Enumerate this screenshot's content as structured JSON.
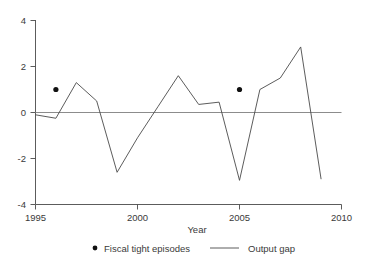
{
  "chart_data": {
    "type": "line",
    "title": "",
    "subtitle": "",
    "xlabel": "Year",
    "ylabel": "",
    "xlim": [
      1995,
      2010
    ],
    "ylim": [
      -4,
      4
    ],
    "grid": false,
    "legend_position": "bottom",
    "x_ticks": [
      1995,
      2000,
      2005,
      2010
    ],
    "x_tick_labels": [
      "1995",
      "2000",
      "2005",
      "2010"
    ],
    "y_ticks": [
      4,
      2,
      0,
      -2,
      -4
    ],
    "y_tick_labels": [
      "4",
      "2",
      "0",
      "-2",
      "-4"
    ],
    "zero_line": 0,
    "series": [
      {
        "name": "Output gap",
        "type": "line",
        "x": [
          1995,
          1996,
          1997,
          1998,
          1999,
          2000,
          2001,
          2002,
          2003,
          2004,
          2005,
          2006,
          2007,
          2008,
          2009
        ],
        "values": [
          -0.1,
          -0.25,
          1.3,
          0.5,
          -2.6,
          -1.1,
          0.25,
          1.6,
          0.35,
          0.45,
          -2.95,
          1.0,
          1.5,
          2.85,
          -2.9
        ]
      },
      {
        "name": "Fiscal tight episodes",
        "type": "scatter",
        "x": [
          1996,
          2005
        ],
        "values": [
          1.0,
          1.0
        ]
      }
    ],
    "legend": [
      {
        "label": "Fiscal tight episodes",
        "marker": "dot",
        "color": "#111111"
      },
      {
        "label": "Output gap",
        "marker": "line",
        "color": "#4a4a4a"
      }
    ],
    "colors": {
      "line": "#4a4a4a",
      "dot": "#111111",
      "zero_line": "#8c8c8c",
      "axis": "#4a4a4a",
      "text": "#3a3a3a",
      "background": "#ffffff"
    }
  }
}
